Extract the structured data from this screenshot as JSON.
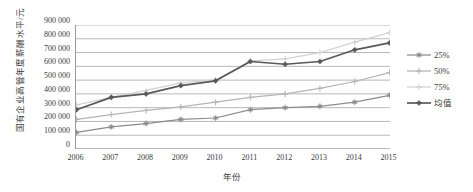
{
  "chart_data": {
    "type": "line",
    "title": "",
    "xlabel": "年份",
    "ylabel": "国有企业高管年度薪酬水平/元",
    "x": [
      2006,
      2007,
      2008,
      2009,
      2010,
      2011,
      2012,
      2013,
      2014,
      2015
    ],
    "xtick_labels": [
      "2006",
      "2007",
      "2008",
      "2009",
      "2010",
      "2011",
      "2012",
      "2013",
      "2014",
      "2015"
    ],
    "ytick_labels": [
      "900 000",
      "800 000",
      "700 000",
      "600 000",
      "500 000",
      "400 000",
      "300 000",
      "200 000",
      "100 000",
      "0"
    ],
    "ytick_values": [
      900000,
      800000,
      700000,
      600000,
      500000,
      400000,
      300000,
      200000,
      100000,
      0
    ],
    "ylim": [
      0,
      900000
    ],
    "xlim": [
      2006,
      2015
    ],
    "grid": true,
    "legend_position": "right",
    "series": [
      {
        "name": "25%",
        "color": "#8c8c8c",
        "marker": "star",
        "values": [
          120000,
          160000,
          185000,
          215000,
          225000,
          285000,
          300000,
          310000,
          340000,
          390000
        ]
      },
      {
        "name": "50%",
        "color": "#b5b5b5",
        "marker": "plus",
        "values": [
          215000,
          250000,
          280000,
          305000,
          340000,
          375000,
          400000,
          440000,
          490000,
          555000
        ]
      },
      {
        "name": "75%",
        "color": "#d2d2d2",
        "marker": "plus",
        "values": [
          320000,
          375000,
          425000,
          480000,
          500000,
          640000,
          655000,
          700000,
          775000,
          845000
        ]
      },
      {
        "name": "均值",
        "color": "#595959",
        "marker": "diamond",
        "values": [
          285000,
          375000,
          400000,
          460000,
          495000,
          635000,
          615000,
          635000,
          720000,
          770000
        ]
      }
    ]
  },
  "legend": {
    "items": [
      {
        "label": "25%"
      },
      {
        "label": "50%"
      },
      {
        "label": "75%"
      },
      {
        "label": "均值"
      }
    ]
  },
  "axes": {
    "y_title": "国有企业高管年度薪酬水平/元",
    "x_title": "年份"
  }
}
